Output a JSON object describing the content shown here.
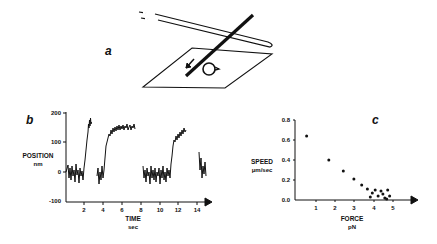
{
  "figure": {
    "panels": {
      "a": {
        "label": "a",
        "description": "schematic of microneedle and filament over surface with rotation arrow"
      },
      "b": {
        "label": "b",
        "ylabel_line1": "POSITION",
        "ylabel_line2": "nm",
        "xlabel_line1": "TIME",
        "xlabel_line2": "sec",
        "yticks": [
          "200",
          "100",
          "0",
          "-100"
        ],
        "xticks": [
          "2",
          "4",
          "6",
          "8",
          "10",
          "12",
          "14"
        ]
      },
      "c": {
        "label": "c",
        "ylabel_line1": "SPEED",
        "ylabel_line2": "μm/sec",
        "xlabel_line1": "FORCE",
        "xlabel_line2": "pN",
        "yticks": [
          "0.8",
          "0.6",
          "0.4",
          "0.2",
          "0.0"
        ],
        "xticks": [
          "1",
          "2",
          "3",
          "4",
          "5"
        ]
      }
    }
  },
  "chart_data": [
    {
      "type": "line",
      "title": "",
      "xlabel": "TIME (sec)",
      "ylabel": "POSITION (nm)",
      "xlim": [
        0,
        15.5
      ],
      "ylim": [
        -100,
        200
      ],
      "grid": false,
      "series": [
        {
          "name": "segment1",
          "x": [
            0.2,
            1.8,
            2.1,
            2.5,
            2.7
          ],
          "y": [
            0,
            0,
            20,
            130,
            120
          ]
        },
        {
          "name": "segment2",
          "x": [
            3.3,
            4.0,
            4.3,
            4.8,
            6.0,
            7.5
          ],
          "y": [
            -10,
            0,
            90,
            115,
            130,
            140
          ]
        },
        {
          "name": "segment3",
          "x": [
            8.3,
            10.0,
            12.0,
            12.6,
            13.0,
            13.5,
            14.8
          ],
          "y": [
            0,
            0,
            -5,
            0,
            90,
            100,
            130
          ]
        },
        {
          "name": "segment4",
          "x": [
            15.3,
            15.5,
            15.8
          ],
          "y": [
            60,
            15,
            10
          ]
        }
      ]
    },
    {
      "type": "scatter",
      "title": "",
      "xlabel": "FORCE (pN)",
      "ylabel": "SPEED (μm/sec)",
      "xlim": [
        0,
        5.5
      ],
      "ylim": [
        0,
        0.8
      ],
      "grid": false,
      "series": [
        {
          "name": "speed-vs-force",
          "x": [
            0.6,
            1.75,
            2.5,
            3.05,
            3.45,
            3.75,
            3.9,
            4.0,
            4.15,
            4.3,
            4.45,
            4.55,
            4.65,
            4.75,
            4.8,
            4.9
          ],
          "y": [
            0.64,
            0.4,
            0.29,
            0.21,
            0.15,
            0.11,
            0.03,
            0.07,
            0.1,
            0.04,
            0.09,
            0.06,
            0.02,
            0.01,
            0.1,
            0.04
          ]
        }
      ]
    }
  ]
}
